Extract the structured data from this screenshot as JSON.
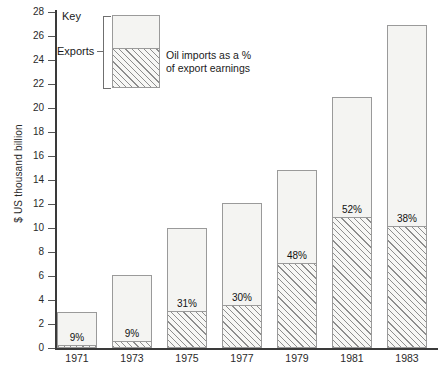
{
  "chart_data": {
    "type": "bar",
    "title": "",
    "xlabel": "",
    "ylabel": "$ US  thousand billion",
    "ylim": [
      0,
      28
    ],
    "ytick_step": 2,
    "grid": false,
    "stacked": true,
    "categories": [
      "1971",
      "1973",
      "1975",
      "1977",
      "1979",
      "1981",
      "1983"
    ],
    "yticks": [
      "0",
      "2",
      "4",
      "6",
      "8",
      "10",
      "12",
      "14",
      "16",
      "18",
      "20",
      "22",
      "24",
      "26",
      "28"
    ],
    "series": [
      {
        "name": "Exports",
        "values": [
          3.0,
          6.1,
          10.0,
          12.1,
          14.8,
          20.9,
          26.9
        ]
      },
      {
        "name": "Oil imports as a % of export earnings",
        "values": [
          0.27,
          0.55,
          3.1,
          3.6,
          7.1,
          10.9,
          10.2
        ]
      }
    ],
    "data_labels": [
      "9%",
      "9%",
      "31%",
      "30%",
      "48%",
      "52%",
      "38%"
    ],
    "percent_values": [
      9,
      9,
      31,
      30,
      48,
      52,
      38
    ],
    "legend_position": "top-left"
  },
  "legend": {
    "key_title": "Key",
    "exports_label": "Exports",
    "caption_line1": "Oil imports as a %",
    "caption_line2": "of export earnings"
  },
  "colors": {
    "bar_fill": "#f4f4f2",
    "bar_border": "#9a9a9a",
    "hatch_line": "#8d8d8d",
    "axis": "#3a3a3a",
    "text": "#1a1a1a"
  }
}
